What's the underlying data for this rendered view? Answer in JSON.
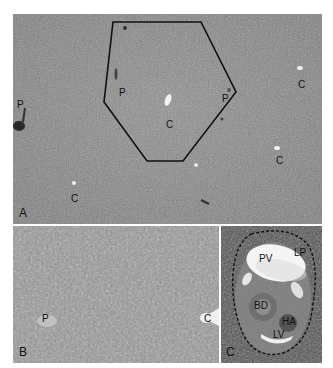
{
  "figure": {
    "panels": [
      {
        "id": "A",
        "letter": "A",
        "description": "Low magnification liver section with hexagonal lobule outline",
        "labels": [
          {
            "text": "P",
            "x": 4,
            "y": 86
          },
          {
            "text": "P",
            "x": 106,
            "y": 74
          },
          {
            "text": "C",
            "x": 153,
            "y": 106
          },
          {
            "text": "P",
            "x": 209,
            "y": 80
          },
          {
            "text": "C",
            "x": 285,
            "y": 66
          },
          {
            "text": "C",
            "x": 263,
            "y": 142
          },
          {
            "text": "C",
            "x": 58,
            "y": 180
          }
        ]
      },
      {
        "id": "B",
        "letter": "B",
        "labels": [
          {
            "text": "P",
            "x": 29,
            "y": 88
          },
          {
            "text": "C",
            "x": 191,
            "y": 88
          }
        ]
      },
      {
        "id": "C",
        "letter": "C",
        "labels": [
          {
            "text": "PV",
            "x": 38,
            "y": 28
          },
          {
            "text": "LP",
            "x": 73,
            "y": 22
          },
          {
            "text": "BD",
            "x": 33,
            "y": 74
          },
          {
            "text": "HA",
            "x": 61,
            "y": 90
          },
          {
            "text": "LV",
            "x": 53,
            "y": 100
          }
        ]
      }
    ],
    "colors": {
      "panel_a_bg": "#8a8a8a",
      "panel_b_bg": "#9a9a9a",
      "panel_c_bg": "#5a5a5a",
      "outline": "#111111"
    }
  }
}
